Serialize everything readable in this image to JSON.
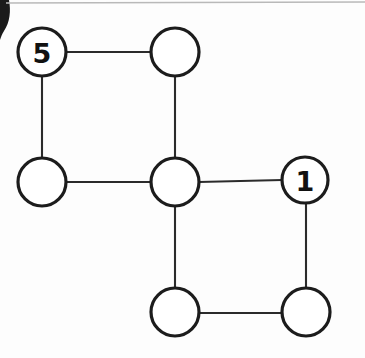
{
  "figure": {
    "background_color": "#fdfdfd",
    "width": 365,
    "height": 358
  },
  "style": {
    "node_fill": "#ffffff",
    "node_stroke": "#1c1c1c",
    "node_stroke_width": 3.2,
    "edge_stroke": "#2b2b2b",
    "edge_stroke_width": 2.1,
    "label_color": "#111111",
    "scan_line_color": "#b9b9b9",
    "scan_artifact_color": "#1a1a1a"
  },
  "graph": {
    "node_radius": 23,
    "nodes": [
      {
        "id": "n-top-left",
        "label": "5",
        "cx": 42,
        "cy": 52,
        "r": 24
      },
      {
        "id": "n-top-center",
        "label": "",
        "cx": 175,
        "cy": 52,
        "r": 24
      },
      {
        "id": "n-mid-left",
        "label": "",
        "cx": 42,
        "cy": 182,
        "r": 24
      },
      {
        "id": "n-center",
        "label": "",
        "cx": 175,
        "cy": 182,
        "r": 24
      },
      {
        "id": "n-mid-right",
        "label": "1",
        "cx": 305,
        "cy": 180,
        "r": 23
      },
      {
        "id": "n-bottom-center",
        "label": "",
        "cx": 175,
        "cy": 312,
        "r": 24
      },
      {
        "id": "n-bottom-right",
        "label": "",
        "cx": 306,
        "cy": 312,
        "r": 24
      }
    ],
    "edges": [
      {
        "id": "e-topleft-topcenter",
        "from": "n-top-left",
        "to": "n-top-center",
        "x1": 66,
        "y1": 52,
        "x2": 151,
        "y2": 52
      },
      {
        "id": "e-topleft-midleft",
        "from": "n-top-left",
        "to": "n-mid-left",
        "x1": 42,
        "y1": 76,
        "x2": 42,
        "y2": 158
      },
      {
        "id": "e-topcenter-center",
        "from": "n-top-center",
        "to": "n-center",
        "x1": 175,
        "y1": 76,
        "x2": 175,
        "y2": 158
      },
      {
        "id": "e-midleft-center",
        "from": "n-mid-left",
        "to": "n-center",
        "x1": 66,
        "y1": 182,
        "x2": 151,
        "y2": 182
      },
      {
        "id": "e-center-midright",
        "from": "n-center",
        "to": "n-mid-right",
        "x1": 199,
        "y1": 182,
        "x2": 282,
        "y2": 180
      },
      {
        "id": "e-center-bottomcenter",
        "from": "n-center",
        "to": "n-bottom-center",
        "x1": 175,
        "y1": 206,
        "x2": 175,
        "y2": 288
      },
      {
        "id": "e-midright-bottomright",
        "from": "n-mid-right",
        "to": "n-bottom-right",
        "x1": 306,
        "y1": 203,
        "x2": 306,
        "y2": 288
      },
      {
        "id": "e-bottomcenter-bottomright",
        "from": "n-bottom-center",
        "to": "n-bottom-right",
        "x1": 199,
        "y1": 313,
        "x2": 282,
        "y2": 313
      }
    ]
  },
  "artifacts": {
    "top_scan_line": {
      "x1": 6,
      "y1": 3,
      "x2": 365,
      "y2": 2
    },
    "corner_curve_path": "M 0,0 L 9,0 C 11,11 10,22 4,31 C 2,34 1,37 0,40 Z"
  }
}
